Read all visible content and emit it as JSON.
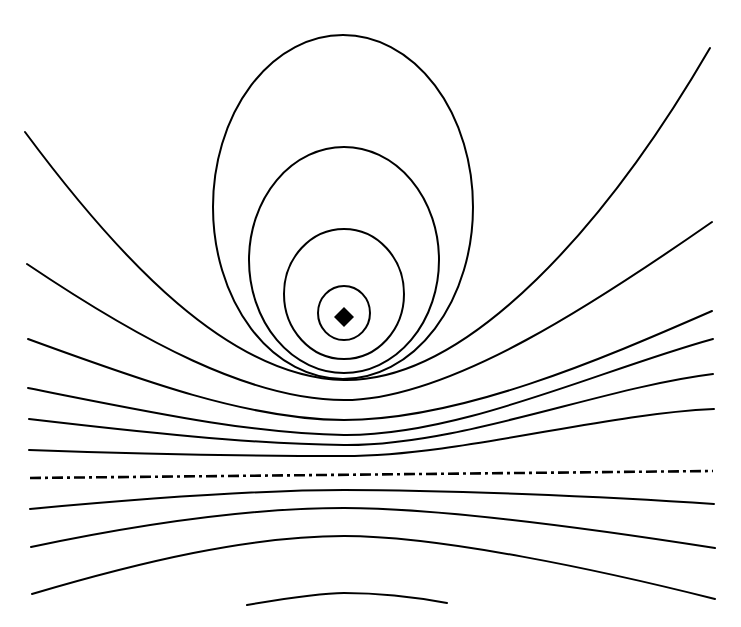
{
  "diagram": {
    "colors": {
      "background": "#ffffff",
      "stroke": "#000000"
    },
    "source": {
      "shape": "diamond",
      "cx": 344,
      "cy": 317,
      "half_size": 10
    },
    "closed_loops": [
      {
        "cx": 344,
        "cy": 313,
        "rx": 26,
        "ry": 27
      },
      {
        "cx": 344,
        "cy": 294,
        "rx": 60,
        "ry": 65
      },
      {
        "cx": 344,
        "cy": 260,
        "rx": 95,
        "ry": 113
      },
      {
        "cx": 343,
        "cy": 207,
        "rx": 130,
        "ry": 172
      }
    ],
    "open_curves_above_axis": [
      {
        "d": "M 25 132 C 120 260, 230 378, 344 380 C 470 382, 610 220, 710 48"
      },
      {
        "d": "M 27 264 C 140 340, 250 400, 344 400 C 450 400, 600 300, 712 222"
      },
      {
        "d": "M 28 339 C 140 380, 250 420, 344 420 C 460 420, 600 360, 712 311"
      },
      {
        "d": "M 28 388 C 140 410, 250 434, 344 435 C 460 436, 600 370, 713 339"
      },
      {
        "d": "M 29 419 C 140 432, 250 444, 344 445 C 460 446, 600 388, 713 374"
      },
      {
        "d": "M 29 450 C 140 454, 250 456, 344 456 C 460 456, 600 414, 714 409"
      }
    ],
    "axis": {
      "x1": 30,
      "y1": 478,
      "x2": 713,
      "y2": 471,
      "style": "dash-dot"
    },
    "open_curves_below_axis": [
      {
        "d": "M 30 509 C 150 498, 260 490, 344 490 C 440 490, 600 496, 714 504"
      },
      {
        "d": "M 31 547 C 150 522, 260 508, 344 508 C 440 508, 600 530, 715 548"
      },
      {
        "d": "M 32 594 C 140 562, 250 536, 344 536 C 440 536, 600 570, 715 599"
      },
      {
        "d": "M 247 605 C 300 596, 330 593, 344 593 C 380 593, 420 598, 447 603"
      }
    ]
  }
}
